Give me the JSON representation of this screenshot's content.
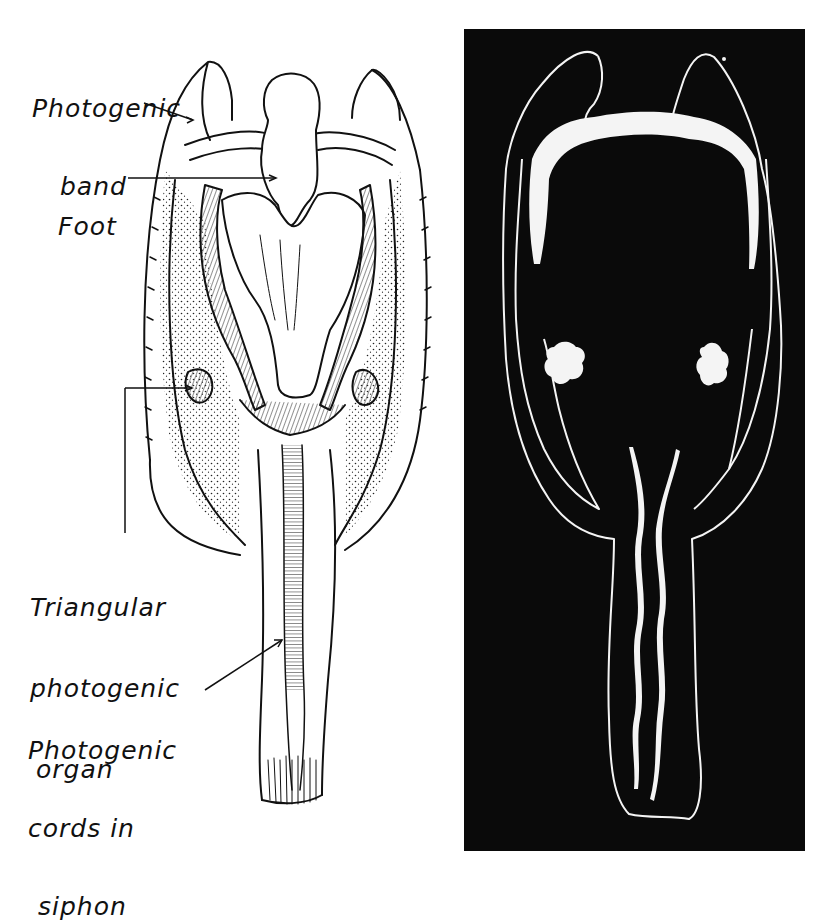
{
  "figure": {
    "left_panel": {
      "description": "Line drawing of a bivalve (Pholas) showing photogenic organs",
      "labels": [
        {
          "id": "photogenic-band",
          "lines": [
            "Photogenic",
            "band"
          ]
        },
        {
          "id": "foot",
          "lines": [
            "Foot"
          ]
        },
        {
          "id": "triangular-photogenic-organ",
          "lines": [
            "Triangular",
            "photogenic",
            "organ"
          ]
        },
        {
          "id": "photogenic-cords",
          "lines": [
            "Photogenic",
            "cords in",
            "siphon"
          ]
        }
      ]
    },
    "right_panel": {
      "description": "Same animal photographed by its own luminescence on black background"
    },
    "colors": {
      "ink": "#111111",
      "paper": "#ffffff",
      "dark_panel": "#0a0a0a",
      "glow": "#f4f4f4"
    }
  }
}
